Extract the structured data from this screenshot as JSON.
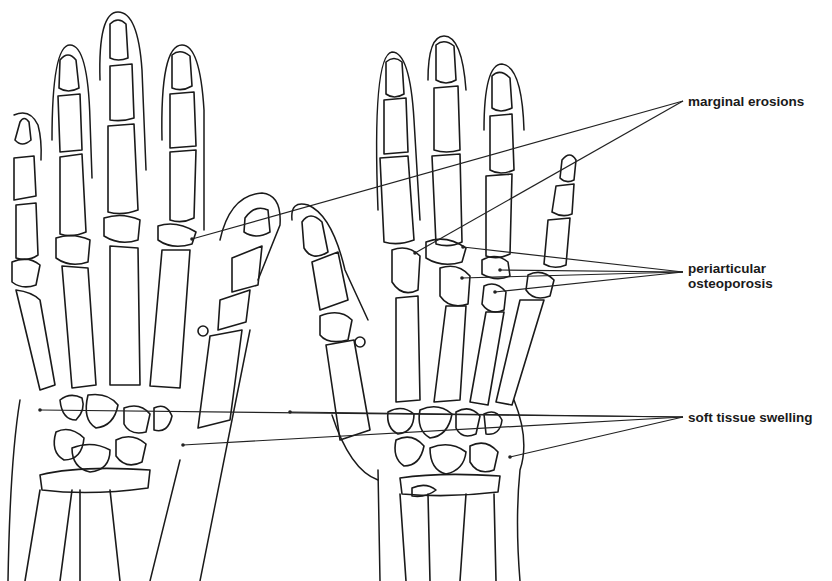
{
  "figure": {
    "hands": [
      "left-hand",
      "right-hand"
    ],
    "colors": {
      "line": "#1a1a1a",
      "background": "#ffffff"
    }
  },
  "labels": [
    {
      "id": "marginal-erosions",
      "lines": [
        "marginal erosions"
      ],
      "x": 688,
      "y": 94,
      "apex": [
        683,
        101
      ],
      "targets": [
        [
          192,
          239
        ],
        [
          415,
          253
        ]
      ]
    },
    {
      "id": "periarticular-osteoporosis",
      "lines": [
        "periarticular",
        "osteoporosis"
      ],
      "x": 688,
      "y": 261,
      "apex": [
        683,
        272
      ],
      "targets": [
        [
          463,
          247
        ],
        [
          500,
          270
        ],
        [
          462,
          278
        ],
        [
          495,
          292
        ]
      ]
    },
    {
      "id": "soft-tissue-swelling",
      "lines": [
        "soft tissue swelling"
      ],
      "x": 688,
      "y": 410,
      "apex": [
        683,
        417
      ],
      "targets": [
        [
          40,
          410
        ],
        [
          183,
          445
        ],
        [
          290,
          412
        ],
        [
          510,
          457
        ]
      ]
    }
  ]
}
